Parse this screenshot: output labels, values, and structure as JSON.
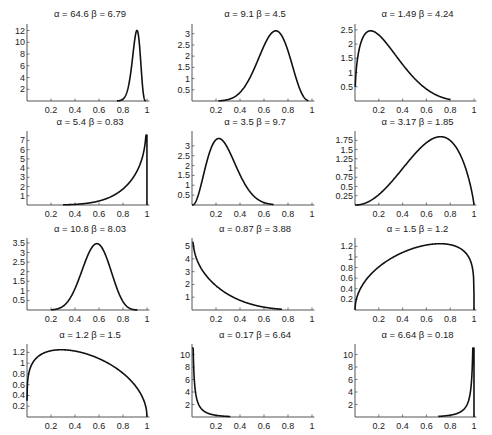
{
  "figure": {
    "width": 492,
    "height": 435,
    "background": "#ffffff",
    "line_color": "#111111",
    "axis_color": "#555555"
  },
  "chart_data": [
    {
      "type": "line",
      "title": "α = 64.6   β = 6.79",
      "alpha": 64.6,
      "beta": 6.79,
      "x_ticks": [
        0.2,
        0.4,
        0.6,
        0.8,
        1
      ],
      "y_ticks": [
        2,
        4,
        6,
        8,
        10,
        12
      ],
      "y_tick_labels": [
        "2",
        "4",
        "6",
        "8",
        "10",
        "12"
      ],
      "xlim": [
        0,
        1.02
      ],
      "ylim": [
        0,
        12.6
      ],
      "grid": false,
      "x_range": [
        0.75,
        0.99
      ]
    },
    {
      "type": "line",
      "title": "α = 9.1      β = 4.5",
      "alpha": 9.1,
      "beta": 4.5,
      "x_ticks": [
        0.2,
        0.4,
        0.6,
        0.8,
        1
      ],
      "y_ticks": [
        0.5,
        1,
        1.5,
        2,
        2.5,
        3
      ],
      "y_tick_labels": [
        "0.5",
        "1",
        "1.5",
        "2",
        "2.5",
        "3"
      ],
      "xlim": [
        0,
        1.02
      ],
      "ylim": [
        0,
        3.3
      ],
      "grid": false,
      "x_range": [
        0.22,
        0.97
      ]
    },
    {
      "type": "line",
      "title": "α = 1.49   β = 4.24",
      "alpha": 1.49,
      "beta": 4.24,
      "x_ticks": [
        0.2,
        0.4,
        0.6,
        0.8,
        1
      ],
      "y_ticks": [
        0.5,
        1,
        1.5,
        2,
        2.5
      ],
      "y_tick_labels": [
        "0.5",
        "1",
        "1.5",
        "2",
        "2.5"
      ],
      "xlim": [
        0,
        1.02
      ],
      "ylim": [
        0,
        2.6
      ],
      "grid": false,
      "x_range": [
        0.002,
        0.8
      ]
    },
    {
      "type": "line",
      "title": "α = 5.4   β = 0.83",
      "alpha": 5.4,
      "beta": 0.83,
      "x_ticks": [
        0.2,
        0.4,
        0.6,
        0.8,
        1
      ],
      "y_ticks": [
        1,
        2,
        3,
        4,
        5,
        6,
        7
      ],
      "y_tick_labels": [
        "1",
        "2",
        "3",
        "4",
        "5",
        "6",
        "7"
      ],
      "xlim": [
        0,
        1.02
      ],
      "ylim": [
        0,
        7.7
      ],
      "grid": false,
      "x_range": [
        0.3,
        0.9995
      ]
    },
    {
      "type": "line",
      "title": "α = 3.5   β = 9.7",
      "alpha": 3.5,
      "beta": 9.7,
      "x_ticks": [
        0.2,
        0.4,
        0.6,
        0.8,
        1
      ],
      "y_ticks": [
        0.5,
        1,
        1.5,
        2,
        2.5,
        3
      ],
      "y_tick_labels": [
        "0.5",
        "1",
        "1.5",
        "2",
        "2.5",
        "3"
      ],
      "xlim": [
        0,
        1.02
      ],
      "ylim": [
        0,
        3.6
      ],
      "grid": false,
      "x_range": [
        0.0,
        0.68
      ]
    },
    {
      "type": "line",
      "title": "α = 3.17   β = 1.85",
      "alpha": 3.17,
      "beta": 1.85,
      "x_ticks": [
        0.2,
        0.4,
        0.6,
        0.8,
        1
      ],
      "y_ticks": [
        0.25,
        0.5,
        0.75,
        1,
        1.25,
        1.5,
        1.75
      ],
      "y_tick_labels": [
        "0.25",
        "0.5",
        "0.75",
        "1",
        "1.25",
        "1.5",
        "1.75"
      ],
      "xlim": [
        0,
        1.02
      ],
      "ylim": [
        0,
        1.92
      ],
      "grid": false,
      "x_range": [
        0.0,
        1.0
      ]
    },
    {
      "type": "line",
      "title": "α = 10.8   β = 8.03",
      "alpha": 10.8,
      "beta": 8.03,
      "x_ticks": [
        0.2,
        0.4,
        0.6,
        0.8,
        1
      ],
      "y_ticks": [
        0.5,
        1,
        1.5,
        2,
        2.5,
        3,
        3.5
      ],
      "y_tick_labels": [
        "0.5",
        "1",
        "1.5",
        "2",
        "2.5",
        "3",
        "3.5"
      ],
      "xlim": [
        0,
        1.02
      ],
      "ylim": [
        0,
        3.6
      ],
      "grid": false,
      "x_range": [
        0.2,
        0.92
      ]
    },
    {
      "type": "line",
      "title": "α = 0.87   β = 3.88",
      "alpha": 0.87,
      "beta": 3.88,
      "x_ticks": [
        0.2,
        0.4,
        0.6,
        0.8,
        1
      ],
      "y_ticks": [
        1,
        2,
        3,
        4,
        5
      ],
      "y_tick_labels": [
        "1",
        "2",
        "3",
        "4",
        "5"
      ],
      "xlim": [
        0,
        1.02
      ],
      "ylim": [
        0,
        5.4
      ],
      "grid": false,
      "x_range": [
        0.004,
        0.75
      ]
    },
    {
      "type": "line",
      "title": "α = 1.5      β = 1.2",
      "alpha": 1.5,
      "beta": 1.2,
      "x_ticks": [
        0.2,
        0.4,
        0.6,
        0.8,
        1
      ],
      "y_ticks": [
        0.2,
        0.4,
        0.6,
        0.8,
        1,
        1.2
      ],
      "y_tick_labels": [
        "0.2",
        "0.4",
        "0.6",
        "0.8",
        "1",
        "1.2"
      ],
      "xlim": [
        0,
        1.02
      ],
      "ylim": [
        0,
        1.3
      ],
      "grid": false,
      "x_range": [
        0.0,
        0.9999
      ]
    },
    {
      "type": "line",
      "title": "α = 1.2   β = 1.5",
      "alpha": 1.2,
      "beta": 1.5,
      "x_ticks": [
        0.2,
        0.4,
        0.6,
        0.8,
        1
      ],
      "y_ticks": [
        0.2,
        0.4,
        0.6,
        0.8,
        1,
        1.2
      ],
      "y_tick_labels": [
        "0.2",
        "0.4",
        "0.6",
        "0.8",
        "1",
        "1.2"
      ],
      "xlim": [
        0,
        1.02
      ],
      "ylim": [
        0,
        1.3
      ],
      "grid": false,
      "x_range": [
        0.0001,
        1.0
      ]
    },
    {
      "type": "line",
      "title": "α = 0.17  β = 6.64",
      "alpha": 0.17,
      "beta": 6.64,
      "x_ticks": [
        0.2,
        0.4,
        0.6,
        0.8,
        1
      ],
      "y_ticks": [
        2,
        4,
        6,
        8,
        10
      ],
      "y_tick_labels": [
        "2",
        "4",
        "6",
        "8",
        "10"
      ],
      "xlim": [
        0,
        1.02
      ],
      "ylim": [
        0,
        11.2
      ],
      "grid": false,
      "x_range": [
        0.0005,
        0.32
      ]
    },
    {
      "type": "line",
      "title": "α = 6.64  β = 0.18",
      "alpha": 6.64,
      "beta": 0.18,
      "x_ticks": [
        0.2,
        0.4,
        0.6,
        0.8,
        1
      ],
      "y_ticks": [
        2,
        4,
        6,
        8,
        10
      ],
      "y_tick_labels": [
        "2",
        "4",
        "6",
        "8",
        "10"
      ],
      "xlim": [
        0,
        1.02
      ],
      "ylim": [
        0,
        11.2
      ],
      "grid": false,
      "x_range": [
        0.7,
        0.9999
      ]
    }
  ],
  "layout": {
    "columns": [
      {
        "x0": 27,
        "x1": 147
      },
      {
        "x0": 192,
        "x1": 312
      },
      {
        "x0": 355,
        "x1": 474
      }
    ],
    "rows": [
      {
        "title_y": 17,
        "top": 27,
        "axis_y": 101
      },
      {
        "title_y": 125,
        "top": 134,
        "axis_y": 205
      },
      {
        "title_y": 232,
        "top": 241,
        "axis_y": 310
      },
      {
        "title_y": 338,
        "top": 347,
        "axis_y": 417
      }
    ]
  }
}
